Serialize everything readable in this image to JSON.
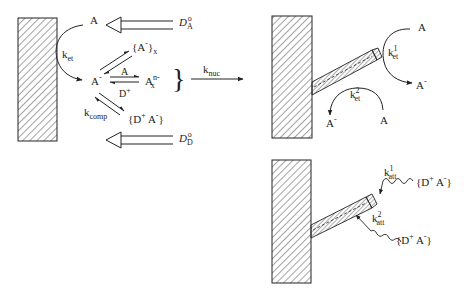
{
  "left_panel": {
    "species_A": "A",
    "species_A_minus": "A",
    "minus": "-",
    "k_et": {
      "base": "k",
      "sub": "et"
    },
    "diffusion_A": {
      "symbol": "D",
      "sub": "A",
      "sup": "o"
    },
    "diffusion_D": {
      "symbol": "D",
      "sub": "D",
      "sup": "o"
    },
    "aggregate": {
      "text": "{A",
      "sup": "-",
      "close": "}",
      "sub": "x"
    },
    "oligomer": {
      "base": "A",
      "sup": "n-",
      "sub": "x"
    },
    "reagent_A": "A",
    "reagent_D": {
      "base": "D",
      "sup": "+"
    },
    "k_comp": {
      "base": "k",
      "sub": "comp"
    },
    "complex": {
      "open": "{D",
      "sup1": "+",
      "mid": " A",
      "sup2": "-",
      "close": "}"
    },
    "brace": "}",
    "k_nuc": {
      "base": "k",
      "sub": "nuc"
    }
  },
  "top_right_panel": {
    "A_top": "A",
    "A_minus_right": {
      "base": "A",
      "sup": "-"
    },
    "k_et1": {
      "base": "k",
      "sub": "et",
      "sup": "1"
    },
    "k_et2": {
      "base": "k",
      "sub": "et",
      "sup": "2"
    },
    "A_minus_bottom": {
      "base": "A",
      "sup": "-"
    },
    "A_bottom": "A"
  },
  "bottom_right_panel": {
    "k_att1": {
      "base": "k",
      "sub": "att",
      "sup": "1"
    },
    "k_att2": {
      "base": "k",
      "sub": "att",
      "sup": "2"
    },
    "complex1": {
      "open": "{D",
      "sup1": "+",
      "mid": " A",
      "sup2": "-",
      "close": "}"
    },
    "complex2": {
      "open": "{D",
      "sup1": "+",
      "mid": " A",
      "sup2": "-",
      "close": "}"
    }
  }
}
